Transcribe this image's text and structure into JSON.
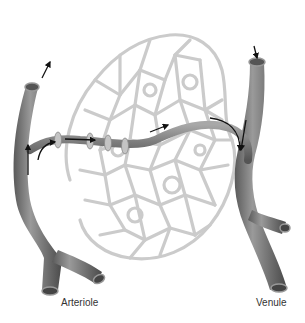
{
  "diagram": {
    "labels": {
      "arteriole": "Arteriole",
      "venule": "Venule"
    },
    "colors": {
      "vessel": "#7a7a7a",
      "vessel_highlight": "#b5b5b5",
      "vessel_shadow": "#4a4a4a",
      "capillary_network": "#c9c9c9",
      "sphincter": "#bdbdbd",
      "arrow": "#111111",
      "background": "#ffffff"
    },
    "flow_arrows": [
      {
        "location": "arteriole top opening",
        "direction": "out/up"
      },
      {
        "location": "arteriole to metarteriole",
        "direction": "up then right"
      },
      {
        "location": "metarteriole",
        "direction": "right"
      },
      {
        "location": "thoroughfare channel",
        "direction": "right"
      },
      {
        "location": "thoroughfare channel to venule",
        "direction": "down"
      },
      {
        "location": "venule top opening",
        "direction": "in/down"
      }
    ],
    "precapillary_sphincters": 4
  }
}
